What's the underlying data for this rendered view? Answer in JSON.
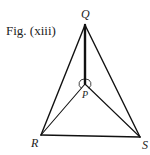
{
  "figure": {
    "caption": "Fig. (xiii)"
  },
  "points": {
    "Q": {
      "label": "Q",
      "x": 85,
      "y": 25
    },
    "P": {
      "label": "P",
      "x": 85,
      "y": 84
    },
    "R": {
      "label": "R",
      "x": 41,
      "y": 135
    },
    "S": {
      "label": "S",
      "x": 140,
      "y": 137
    }
  },
  "segments": [
    "QR",
    "QS",
    "RS",
    "QP",
    "PR",
    "PS"
  ],
  "annotations": {
    "angle_marks_at": "P"
  },
  "colors": {
    "line": "#111111",
    "text": "#222222"
  }
}
